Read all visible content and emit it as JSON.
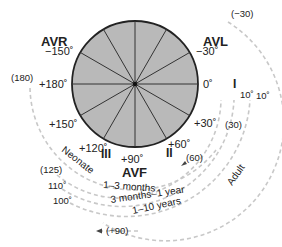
{
  "diagram": {
    "colors": {
      "circle_fill": "#b9b9b9",
      "circle_stroke": "#222222",
      "spoke": "#333333",
      "dashed_arc": "#c8c8c8",
      "text": "#222222"
    },
    "leads": {
      "avr": "AVR",
      "avl": "AVL",
      "avf": "AVF",
      "i": "I",
      "ii": "II",
      "iii": "III"
    },
    "angles": {
      "minus150": "−150˚",
      "minus30": "−30˚",
      "plus180": "+180˚",
      "zero": "0˚",
      "plus150": "+150˚",
      "plus30": "+30˚",
      "plus120": "+120˚",
      "plus60": "+60˚",
      "plus90": "+90˚"
    },
    "age_groups": {
      "neonate": "Neonate",
      "m1_3": "1–3 months",
      "m3_y1": "3 months–1 year",
      "y1_10": "1–10 years",
      "adult": "Adult"
    },
    "range_values": {
      "p180": "(180)",
      "p125": "(125)",
      "d110": "110˚",
      "d100": "100˚",
      "p90": "(+90)",
      "m30": "(−30)",
      "d10a": "10˚",
      "d10b": "10˚",
      "p30": "(30)",
      "p60": "(60)"
    }
  }
}
